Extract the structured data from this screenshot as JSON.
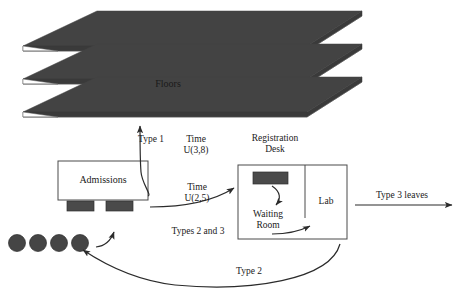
{
  "diagram": {
    "colors": {
      "slab_top": "#434343",
      "slab_side": "#3a3a3a",
      "desk_fill": "#4a4a4a",
      "person_fill": "#454545",
      "stroke": "#4a4a4a",
      "text": "#1a1a1a",
      "background": "#ffffff"
    },
    "floors": {
      "label": "Floors",
      "count": 3
    },
    "admissions": {
      "label": "Admissions",
      "stations": 2
    },
    "registration": {
      "label_line1": "Registration",
      "label_line2": "Desk"
    },
    "waiting_room": {
      "label_line1": "Waiting",
      "label_line2": "Room"
    },
    "lab": {
      "label": "Lab"
    },
    "arrivals": {
      "people_count": 4
    },
    "flows": [
      {
        "name": "type-1-to-floors",
        "label_left": "Type 1",
        "label_right_line1": "Time",
        "label_right_line2": "U(3,8)"
      },
      {
        "name": "types-2-and-3-to-registration",
        "label_top_line1": "Time",
        "label_top_line2": "U(2,5)",
        "label_bottom": "Types 2 and 3"
      },
      {
        "name": "type-3-leaves",
        "label": "Type 3 leaves"
      },
      {
        "name": "type-2-returns",
        "label": "Type 2"
      }
    ]
  }
}
